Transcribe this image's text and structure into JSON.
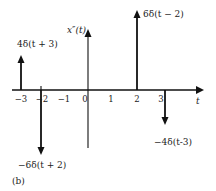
{
  "diagram": {
    "caption": "(b)",
    "x_axis_label": "t",
    "y_axis_label": "x″(t)",
    "ticks": [
      "−3",
      "−2",
      "−1",
      "0",
      "1",
      "2",
      "3"
    ],
    "impulses": [
      {
        "t": -3,
        "weight": 4,
        "label": "4δ(t + 3)"
      },
      {
        "t": -2,
        "weight": -6,
        "label": "−6δ(t + 2)"
      },
      {
        "t": 2,
        "weight": 6,
        "label": "6δ(t − 2)"
      },
      {
        "t": 3,
        "weight": -4,
        "label": "−4δ(t-3)"
      }
    ],
    "colors": {
      "stroke": "#111111",
      "text": "#222222"
    }
  }
}
